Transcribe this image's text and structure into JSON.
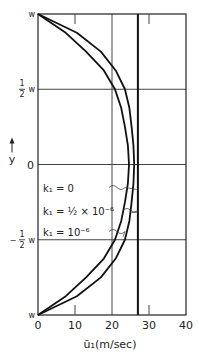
{
  "chart_data": {
    "type": "line",
    "title": "",
    "xlabel": "ū₁(m/sec)",
    "ylabel": "y",
    "xlim": [
      0,
      40
    ],
    "ylim": [
      -1,
      1
    ],
    "x_ticks": [
      0,
      10,
      20,
      30,
      40
    ],
    "x_tick_labels": [
      "0",
      "10",
      "20",
      "30",
      "40"
    ],
    "y_ticks": [
      1,
      0.5,
      0,
      -0.5,
      -1
    ],
    "y_tick_labels": [
      {
        "main": "w",
        "frac": ""
      },
      {
        "main": "w",
        "frac": "1/2"
      },
      {
        "main": "0",
        "frac": ""
      },
      {
        "main": "w",
        "frac": "-1/2"
      },
      {
        "main": "w",
        "frac": ""
      }
    ],
    "grid": {
      "horizontal": [
        0.5,
        0,
        -0.5
      ],
      "vertical": [
        20
      ]
    },
    "minor_ticks_x": [
      10,
      30
    ],
    "series": [
      {
        "name": "k₁ = 0",
        "label_main": "k₁ = 0",
        "y": [
          -1,
          1
        ],
        "x": [
          27,
          27
        ]
      },
      {
        "name": "k₁ = 1/2 × 10⁻⁶",
        "label_main": "k₁ = ½ × 10⁻⁶",
        "y": [
          -1,
          -0.875,
          -0.75,
          -0.625,
          -0.5,
          -0.375,
          -0.25,
          -0.125,
          0,
          0.125,
          0.25,
          0.375,
          0.5,
          0.625,
          0.75,
          0.875,
          1
        ],
        "x": [
          0,
          10.5,
          17,
          21,
          23.5,
          24.7,
          25.3,
          25.8,
          26,
          25.8,
          25.3,
          24.7,
          23.5,
          21,
          17,
          10.5,
          0
        ]
      },
      {
        "name": "k₁ = 10⁻⁶",
        "label_main": "k₁ = 10⁻⁶",
        "y": [
          -1,
          -0.875,
          -0.75,
          -0.625,
          -0.5,
          -0.375,
          -0.25,
          -0.125,
          0,
          0.125,
          0.25,
          0.375,
          0.5,
          0.625,
          0.75,
          0.875,
          1
        ],
        "x": [
          0,
          7.5,
          13,
          17.8,
          20.8,
          22.5,
          23.5,
          24.3,
          24.6,
          24.3,
          23.5,
          22.5,
          20.8,
          17.8,
          13,
          7.5,
          0
        ]
      }
    ],
    "legend": {
      "placement": "inside-left-lower-middle",
      "entries": [
        "k₁ = 0",
        "k₁ = ½ × 10⁻⁶",
        "k₁ = 10⁻⁶"
      ]
    }
  }
}
